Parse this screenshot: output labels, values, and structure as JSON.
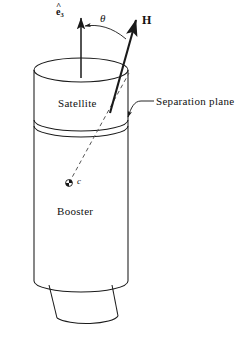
{
  "figure": {
    "width": 247,
    "height": 338,
    "background_color": "#ffffff",
    "line_color": "#1a1a1a"
  },
  "labels": {
    "satellite": "Satellite",
    "booster": "Booster",
    "separation_plane": "Separation plane",
    "theta": "θ",
    "angular_momentum": "H",
    "center_of_mass": "c",
    "unit_vector_hat": "^",
    "unit_vector_base": "e",
    "unit_vector_subscript": "3"
  },
  "geometry": {
    "cylinder": {
      "left_x": 34,
      "right_x": 128,
      "top_ellipse_center_y": 70,
      "top_ellipse_ry": 12,
      "bottom_ellipse_center_y": 281,
      "bottom_ellipse_ry": 11,
      "separation_plane_y": 122
    },
    "nozzle": {
      "top_left_x": 49,
      "top_right_x": 112,
      "top_y": 284,
      "bottom_left_x": 57,
      "bottom_right_x": 118,
      "bottom_y": 322
    },
    "e3_axis": {
      "base_x": 81,
      "base_y": 78,
      "tip_x": 81,
      "tip_y": 14
    },
    "h_vector": {
      "base_x": 69,
      "base_y": 183,
      "tip_x": 137,
      "tip_y": 16
    },
    "center_point": {
      "x": 69,
      "y": 183,
      "radius": 3.2
    },
    "theta_arc": {
      "from_x": 83,
      "from_y": 27,
      "to_x": 126,
      "to_y": 39
    },
    "separation_leader": {
      "text_x": 153,
      "text_y": 102,
      "arrow_x": 127,
      "arrow_y": 119
    }
  }
}
